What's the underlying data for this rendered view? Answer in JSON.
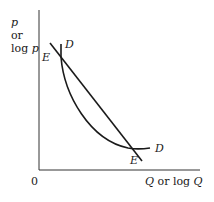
{
  "diagram": {
    "y_axis_label": {
      "line1": "p",
      "line2": "or",
      "line3_prefix": "log ",
      "line3_var": "p"
    },
    "x_axis_label": {
      "var1": "Q",
      "middle": " or log ",
      "var2": "Q"
    },
    "origin_label": "0",
    "curves": [
      {
        "name": "E",
        "type": "straight line",
        "label_top": "E",
        "label_bottom": "E"
      },
      {
        "name": "D",
        "type": "convex curve",
        "label_top": "D",
        "label_bottom": "D"
      }
    ],
    "colors": {
      "stroke": "#1a1a1a",
      "background": "#ffffff"
    }
  }
}
